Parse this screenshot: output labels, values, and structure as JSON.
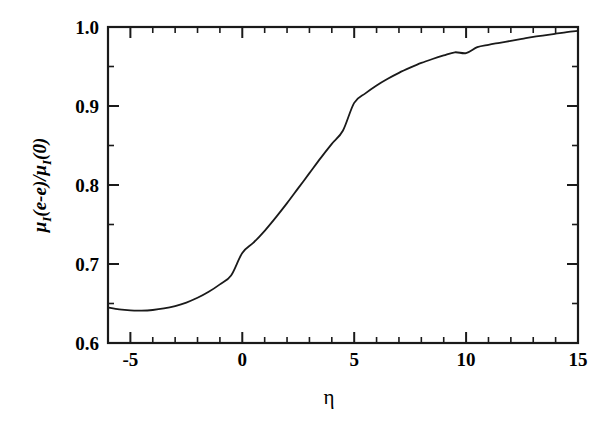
{
  "figure": {
    "background_color": "#ffffff",
    "line_color": "#1a1a1a",
    "axis_color": "#1a1a1a"
  },
  "axes": {
    "x": {
      "label": "η",
      "tick_labels": [
        "-5",
        "0",
        "5",
        "10",
        "15"
      ],
      "tick_values": [
        -5,
        0,
        5,
        10,
        15
      ],
      "minor_tick_step": 1,
      "range": [
        -6,
        15
      ]
    },
    "y": {
      "label_parts": {
        "mu1": "μ",
        "sub1": "I",
        "open": "(",
        "ee": "e-e",
        "close_slash": ")/",
        "mu2": "μ",
        "sub2": "I",
        "zero": "(0)"
      },
      "label_plain": "μ_I(e-e)/μ_I(0)",
      "tick_labels": [
        "0.6",
        "0.7",
        "0.8",
        "0.9",
        "1.0"
      ],
      "tick_values": [
        0.6,
        0.7,
        0.8,
        0.9,
        1.0
      ],
      "minor_tick_step": 0.05,
      "range": [
        0.6,
        1.0
      ]
    }
  },
  "chart_data": {
    "type": "line",
    "title": "",
    "xlabel": "η",
    "ylabel": "μ_I(e-e)/μ_I(0)",
    "xlim": [
      -6,
      15
    ],
    "ylim": [
      0.6,
      1.0
    ],
    "grid": false,
    "legend": false,
    "series": [
      {
        "name": "mu_I(e-e)/mu_I(0)",
        "x": [
          -6.0,
          -5.5,
          -5.0,
          -4.5,
          -4.0,
          -3.5,
          -3.0,
          -2.5,
          -2.0,
          -1.5,
          -1.0,
          -0.5,
          0.0,
          0.5,
          1.0,
          1.5,
          2.0,
          2.5,
          3.0,
          3.5,
          4.0,
          4.5,
          5.0,
          5.5,
          6.0,
          6.5,
          7.0,
          7.5,
          8.0,
          8.5,
          9.0,
          9.5,
          10.0,
          10.5,
          11.0,
          11.5,
          12.0,
          12.5,
          13.0,
          13.5,
          14.0,
          14.5,
          15.0
        ],
        "y": [
          0.645,
          0.6425,
          0.6412,
          0.641,
          0.6418,
          0.6437,
          0.6468,
          0.6512,
          0.6572,
          0.6648,
          0.6742,
          0.6855,
          0.714,
          0.727,
          0.742,
          0.759,
          0.777,
          0.796,
          0.815,
          0.834,
          0.852,
          0.869,
          0.904,
          0.916,
          0.926,
          0.9345,
          0.942,
          0.9485,
          0.9545,
          0.9595,
          0.964,
          0.968,
          0.967,
          0.9745,
          0.9775,
          0.98,
          0.9825,
          0.985,
          0.9875,
          0.9895,
          0.9915,
          0.9935,
          0.995
        ]
      }
    ],
    "notes": {
      "minimum": {
        "x": -4.5,
        "y": 0.641
      },
      "value_at_0": 0.714,
      "value_at_5": 0.904,
      "value_at_10": 0.967,
      "value_at_15": 0.995
    }
  }
}
